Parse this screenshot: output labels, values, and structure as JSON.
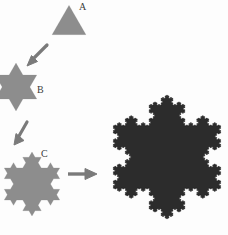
{
  "figure": {
    "background_color": "#fdfdfd",
    "stage_fill_light": "#8d8d8d",
    "stage_fill_dark": "#2c2c2c",
    "arrow_color": "#7a7a7a",
    "label_color": "#3b3b3b"
  },
  "labels": {
    "a": "A",
    "b": "B",
    "c": "C"
  },
  "stages": [
    {
      "id": "a",
      "label": "A",
      "iteration": 0,
      "name": "equilateral-triangle",
      "sides": 3,
      "fill": "#8d8d8d",
      "size_px": 33
    },
    {
      "id": "b",
      "label": "B",
      "iteration": 1,
      "name": "six-pointed-star",
      "sides": 12,
      "fill": "#8d8d8d",
      "size_px": 46
    },
    {
      "id": "c",
      "label": "C",
      "iteration": 2,
      "name": "koch-snowflake-iteration-2",
      "sides": 48,
      "fill": "#8d8d8d",
      "size_px": 62
    },
    {
      "id": "d",
      "label": "",
      "iteration": 6,
      "name": "koch-snowflake-final",
      "sides": 12288,
      "fill": "#2c2c2c",
      "size_px": 122
    }
  ],
  "arrows": [
    {
      "id": "arrow-1",
      "from": "A",
      "to": "B",
      "direction": "down-left"
    },
    {
      "id": "arrow-2",
      "from": "B",
      "to": "C",
      "direction": "down-left"
    },
    {
      "id": "arrow-3",
      "from": "C",
      "to": "D",
      "direction": "right"
    }
  ],
  "chart_data": {
    "type": "diagram",
    "stage_labels": [
      "A",
      "B",
      "C",
      ""
    ],
    "iterations": [
      0,
      1,
      2,
      6
    ],
    "segment_counts": [
      3,
      12,
      48,
      12288
    ]
  }
}
